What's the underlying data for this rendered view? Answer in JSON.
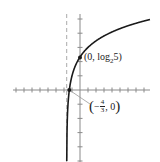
{
  "chart_data": {
    "type": "line",
    "title": "",
    "function": "y = log2(3x + 5)",
    "xlabel": "",
    "ylabel": "",
    "xlim": [
      -8.3,
      8.8
    ],
    "ylim": [
      -5.1,
      5.6
    ],
    "grid": false,
    "asymptote": {
      "type": "vertical",
      "x": -1.6667,
      "style": "dashed"
    },
    "x_ticks_per_unit": 1,
    "y_ticks_per_unit": 1,
    "points": [
      {
        "x": 0,
        "y": 2.3219,
        "label": "(0, log₂5)"
      },
      {
        "x": -1.3333,
        "y": 0,
        "label": "(−4/3, 0)"
      }
    ],
    "series": [
      {
        "name": "y = log2(3x+5)",
        "x": [
          -1.66,
          -1.65,
          -1.6,
          -1.5,
          -1.3333,
          -1.0,
          -0.5,
          0,
          1,
          2,
          3,
          4,
          5,
          6,
          7,
          8.7
        ],
        "values": [
          -7.4,
          -4.9,
          -2.3,
          -1.0,
          0,
          1.0,
          1.81,
          2.32,
          3.0,
          3.46,
          3.81,
          4.09,
          4.32,
          4.52,
          4.7,
          4.99
        ]
      }
    ]
  },
  "labels": {
    "point1": {
      "prefix": "(0, log",
      "sub": "2",
      "suffix": "5)"
    },
    "point2": {
      "open": "(",
      "minus": "−",
      "num": "4",
      "den": "3",
      "tail": ", 0",
      "close": ")"
    }
  },
  "colors": {
    "curve": "#1a1a1a",
    "axis": "#8a8a8a",
    "asymptote": "#aaaaaa"
  }
}
